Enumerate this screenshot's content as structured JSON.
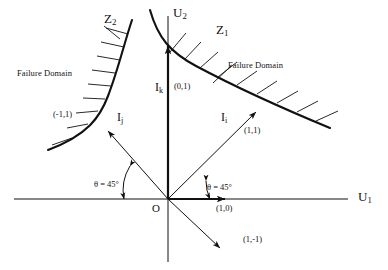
{
  "figure": {
    "type": "diagram",
    "background_color": "#ffffff",
    "line_color": "#111111"
  },
  "axes": {
    "horizontal": {
      "name": "U1",
      "label": "U",
      "subscript": "1"
    },
    "vertical": {
      "name": "U2",
      "label": "U",
      "subscript": "2"
    },
    "origin_label": "O"
  },
  "curves": [
    {
      "id": "z1",
      "label": "Z",
      "subscript": "1",
      "side": "right",
      "hatch_direction": "outward-upper-right"
    },
    {
      "id": "z2",
      "label": "Z",
      "subscript": "2",
      "side": "left",
      "hatch_direction": "outward-left"
    }
  ],
  "domain_labels": [
    {
      "id": "failure-domain-left",
      "text": "Failure Domain"
    },
    {
      "id": "failure-domain-right",
      "text": "Failure Domain"
    }
  ],
  "vectors": [
    {
      "id": "i-k",
      "label": "I",
      "subscript": "k",
      "coordinate": "(0,1)",
      "direction_deg": 90
    },
    {
      "id": "i-i",
      "label": "I",
      "subscript": "i",
      "coordinate": "(1,1)",
      "direction_deg": 45
    },
    {
      "id": "i-j",
      "label": "I",
      "subscript": "j",
      "coordinate": "(-1,1)",
      "direction_deg": 135
    },
    {
      "id": "unit-x",
      "label": "",
      "subscript": "",
      "coordinate": "(1,0)",
      "direction_deg": 0
    },
    {
      "id": "down-right",
      "label": "",
      "subscript": "",
      "coordinate": "(1,-1)",
      "direction_deg": -45
    }
  ],
  "angles": [
    {
      "id": "angle-left",
      "text": "θ = 45°"
    },
    {
      "id": "angle-right",
      "text": "θ = 45°"
    }
  ]
}
